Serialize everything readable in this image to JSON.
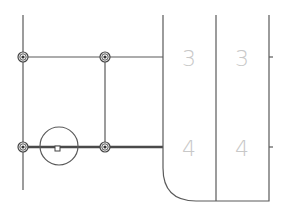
{
  "drawing": {
    "cells": [
      {
        "row": 1,
        "col": 1,
        "label": "3"
      },
      {
        "row": 1,
        "col": 2,
        "label": "3"
      },
      {
        "row": 2,
        "col": 1,
        "label": "4"
      },
      {
        "row": 2,
        "col": 2,
        "label": "4"
      }
    ],
    "nodes_count": 4,
    "colors": {
      "line": "#5a5a5a",
      "label": "#c8c8c8",
      "background": "#ffffff"
    }
  }
}
